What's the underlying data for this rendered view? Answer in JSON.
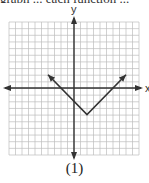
{
  "caption_top": "graph ... each function ...",
  "figure_label": "(1)",
  "axes": {
    "x_label": "x",
    "y_label": "y"
  },
  "grid": {
    "cells_x": 20,
    "cells_y": 20,
    "x_range": [
      -10,
      10
    ],
    "y_range": [
      -10,
      10
    ]
  },
  "function": {
    "type": "absolute-value",
    "expression": "y = |x - 2| - 4",
    "vertex": [
      2,
      -4
    ],
    "left_arrow_end": [
      -4,
      2
    ],
    "right_arrow_end": [
      8,
      2
    ]
  },
  "colors": {
    "grid": "#bdbdbd",
    "axis": "#333333",
    "curve": "#333333"
  }
}
